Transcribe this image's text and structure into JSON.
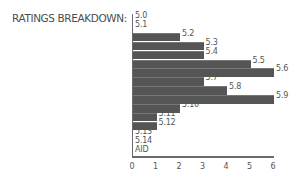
{
  "chart_data": {
    "type": "bar",
    "orientation": "horizontal",
    "title": "RATINGS BREAKDOWN:",
    "xlabel": "",
    "ylabel": "",
    "categories": [
      "5.0",
      "5.1",
      "5.2",
      "5.3",
      "5.4",
      "5.5",
      "5.6",
      "5.7",
      "5.8",
      "5.9",
      "5.10",
      "5.11",
      "5.12",
      "5.13",
      "5.14",
      "AID"
    ],
    "values": [
      0,
      0,
      2,
      3,
      3,
      5,
      6,
      3,
      4,
      6,
      2,
      1,
      1,
      0,
      0,
      0
    ],
    "xticks": [
      "0",
      "1",
      "2",
      "3",
      "4",
      "5",
      "6"
    ],
    "xlim": [
      0,
      6
    ],
    "grid": false,
    "legend": null,
    "bar_color": "#555555"
  }
}
